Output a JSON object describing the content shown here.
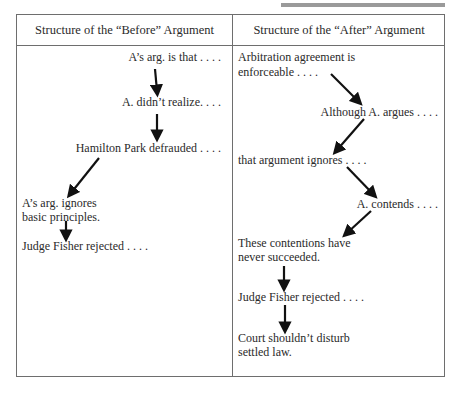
{
  "decor": {
    "top_bar_color": "#9a9a9a",
    "border_color": "#6e6e6e"
  },
  "table": {
    "headers": {
      "before": "Structure of the “Before” Argument",
      "after": "Structure of the “After” Argument"
    },
    "before": [
      {
        "line1": "A’s arg. is that . . . ."
      },
      {
        "line1": "A. didn’t realize. . . ."
      },
      {
        "line1": "Hamilton Park defrauded . . . ."
      },
      {
        "line1": "A’s arg. ignores",
        "line2": "basic principles."
      },
      {
        "line1": "Judge Fisher rejected . . . ."
      }
    ],
    "after": [
      {
        "line1": "Arbitration agreement is",
        "line2": "enforceable . . . ."
      },
      {
        "line1": "Although A. argues . . . ."
      },
      {
        "line1": "that argument ignores . . . ."
      },
      {
        "line1": "A. contends . . . ."
      },
      {
        "line1": "These contentions have",
        "line2": "never succeeded."
      },
      {
        "line1": "Judge Fisher rejected . . . ."
      },
      {
        "line1": "Court shouldn’t disturb",
        "line2": "settled law."
      }
    ],
    "arrow_icon": "down-arrow-icon"
  }
}
